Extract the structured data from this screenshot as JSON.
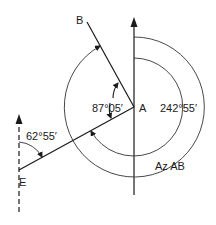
{
  "diagram": {
    "type": "survey-azimuth",
    "points": {
      "A": {
        "label": "A"
      },
      "B": {
        "label": "B"
      },
      "E": {
        "label": "E"
      }
    },
    "angles": {
      "interior_BAE": "87°05′",
      "azimuth_E": "62°55′",
      "azimuth_AE_back": "242°55′",
      "azimuth_AB_label": "Az AB"
    },
    "colors": {
      "line": "#1a1a1a",
      "arc": "#333333",
      "background": "#ffffff"
    }
  }
}
